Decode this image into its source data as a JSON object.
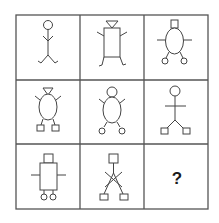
{
  "puzzle": {
    "type": "3x3 figure matrix reasoning puzzle",
    "grid": {
      "rows": 3,
      "cols": 3,
      "line_color": "#555555",
      "figure_color": "#444444"
    },
    "cells": [
      {
        "row": 1,
        "col": 1,
        "head": "circle",
        "body": "line",
        "arms": "line-with-bent-ends",
        "feet": "none",
        "description": "stick figure with circle head"
      },
      {
        "row": 1,
        "col": 2,
        "head": "inverted-triangle",
        "body": "rectangle",
        "arms": "angled-lines",
        "feet": "hooks",
        "description": "rectangle body with triangle head"
      },
      {
        "row": 1,
        "col": 3,
        "head": "square",
        "body": "ellipse",
        "arms": "horizontal-lines",
        "feet": "circles",
        "description": "oval body with square head and circle feet"
      },
      {
        "row": 2,
        "col": 1,
        "head": "inverted-triangle",
        "body": "ellipse",
        "arms": "angled-lines",
        "feet": "squares",
        "description": "oval body with triangle head and square feet"
      },
      {
        "row": 2,
        "col": 2,
        "head": "circle",
        "body": "ellipse",
        "arms": "angled-lines",
        "feet": "circles",
        "description": "oval body with circle head and circle feet"
      },
      {
        "row": 2,
        "col": 3,
        "head": "circle",
        "body": "line",
        "arms": "horizontal-line",
        "feet": "squares",
        "description": "stick figure with circle head and square feet"
      },
      {
        "row": 3,
        "col": 1,
        "head": "square",
        "body": "rectangle",
        "arms": "horizontal-lines",
        "feet": "circles",
        "description": "rectangle body with square head and circle feet"
      },
      {
        "row": 3,
        "col": 2,
        "head": "square",
        "body": "line",
        "arms": "crossed-lines",
        "feet": "squares",
        "description": "stick figure with square head and square feet"
      },
      {
        "row": 3,
        "col": 3,
        "label": "?",
        "description": "missing figure"
      }
    ]
  }
}
